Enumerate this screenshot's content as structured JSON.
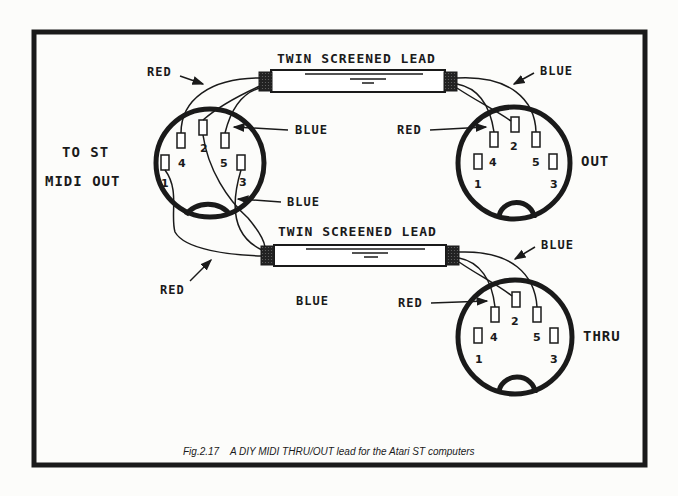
{
  "figure": {
    "caption": "Fig.2.17    A DIY MIDI THRU/OUT lead for the Atari ST computers"
  },
  "leads": [
    {
      "label": "TWIN SCREENED LEAD"
    },
    {
      "label": "TWIN SCREENED LEAD"
    }
  ],
  "connectors": {
    "input": {
      "label_line1": "TO ST",
      "label_line2": "MIDI OUT",
      "pins": [
        "1",
        "2",
        "3",
        "4",
        "5"
      ]
    },
    "out": {
      "label": "OUT",
      "pins": [
        "1",
        "2",
        "3",
        "4",
        "5"
      ]
    },
    "thru": {
      "label": "THRU",
      "pins": [
        "1",
        "2",
        "3",
        "4",
        "5"
      ]
    }
  },
  "wire_labels": {
    "in_red_top": "RED",
    "in_blue_right": "BLUE",
    "in_blue_lower": "BLUE",
    "in_red_bottom": "RED",
    "middle_blue": "BLUE",
    "out_blue": "BLUE",
    "out_red": "RED",
    "thru_blue": "BLUE",
    "thru_red": "RED"
  }
}
